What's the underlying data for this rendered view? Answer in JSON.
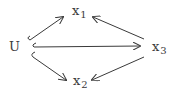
{
  "diagram": {
    "type": "directed-graph",
    "nodes": [
      {
        "id": "U",
        "label": "U",
        "sub": ""
      },
      {
        "id": "x1",
        "label": "x",
        "sub": "1"
      },
      {
        "id": "x2",
        "label": "x",
        "sub": "2"
      },
      {
        "id": "x3",
        "label": "x",
        "sub": "3"
      }
    ],
    "edges": [
      {
        "from": "U",
        "to": "x1"
      },
      {
        "from": "U",
        "to": "x3"
      },
      {
        "from": "U",
        "to": "x2"
      },
      {
        "from": "x3",
        "to": "x1"
      },
      {
        "from": "x3",
        "to": "x2"
      }
    ],
    "colors": {
      "stroke": "#3a3a3a",
      "text": "#3a3a3a",
      "background": "#ffffff"
    }
  }
}
